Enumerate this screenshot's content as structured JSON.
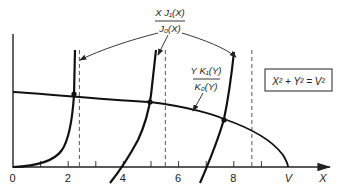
{
  "figure": {
    "left_curve_label": {
      "numerator": "X J₁(X)",
      "denominator": "J₀(X)"
    },
    "right_curve_label": {
      "numerator": "Y K₁(Y)",
      "denominator": "K₀(Y)"
    },
    "constraint_box": "X² + Y² = V²",
    "x_axis": {
      "label": "X",
      "tick_labels": [
        "0",
        "2",
        "4",
        "6",
        "8",
        "V"
      ],
      "major_ticks": [
        0,
        2,
        4,
        6,
        8
      ],
      "minor_ticks": [
        1,
        3,
        5,
        7,
        9
      ],
      "v_value": 10
    },
    "asymptotes": {
      "description": "Dashed vertical lines at zeros of J0",
      "values": [
        2.405,
        5.52,
        8.654
      ]
    },
    "intersections": [
      {
        "x": 2.2
      },
      {
        "x": 4.9
      },
      {
        "x": 7.6
      }
    ]
  }
}
